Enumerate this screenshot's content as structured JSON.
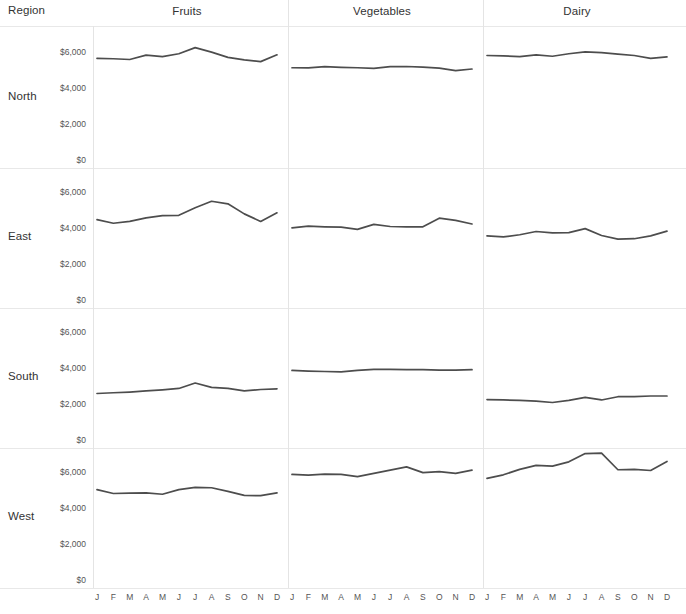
{
  "header": {
    "region_label": "Region"
  },
  "axis": {
    "y_ticks": [
      "$6,000",
      "$4,000",
      "$2,000",
      "$0"
    ],
    "y_values": [
      6000,
      4000,
      2000,
      0
    ],
    "x_ticks": [
      "J",
      "F",
      "M",
      "A",
      "M",
      "J",
      "J",
      "A",
      "S",
      "O",
      "N",
      "D"
    ]
  },
  "colors": {
    "line": "#4d4d4d",
    "gridline": "#e8e8e8",
    "divider": "#e4e4e4",
    "text": "#333333",
    "tick_text": "#555555"
  },
  "chart_data": {
    "type": "line",
    "title": "",
    "xlabel": "",
    "ylabel": "",
    "ylim": [
      0,
      7200
    ],
    "grid": true,
    "legend": "none",
    "layout": "small-multiples grid: rows = Region, columns = Category",
    "row_field": "Region",
    "column_field": "Category",
    "rows": [
      "North",
      "East",
      "South",
      "West"
    ],
    "columns": [
      "Fruits",
      "Vegetables",
      "Dairy"
    ],
    "x": [
      "J",
      "F",
      "M",
      "A",
      "M",
      "J",
      "J",
      "A",
      "S",
      "O",
      "N",
      "D"
    ],
    "panels": [
      {
        "row": "North",
        "column": "Fruits",
        "values": [
          5700,
          5680,
          5640,
          5880,
          5800,
          5960,
          6300,
          6050,
          5760,
          5620,
          5520,
          5900
        ]
      },
      {
        "row": "North",
        "column": "Vegetables",
        "values": [
          5180,
          5170,
          5240,
          5200,
          5180,
          5150,
          5240,
          5250,
          5220,
          5160,
          5020,
          5110
        ]
      },
      {
        "row": "North",
        "column": "Dairy",
        "values": [
          5860,
          5840,
          5800,
          5900,
          5820,
          5960,
          6060,
          6020,
          5940,
          5860,
          5700,
          5780
        ]
      },
      {
        "row": "East",
        "column": "Fruits",
        "values": [
          4520,
          4320,
          4420,
          4620,
          4740,
          4760,
          5180,
          5540,
          5400,
          4840,
          4420,
          4900
        ]
      },
      {
        "row": "East",
        "column": "Vegetables",
        "values": [
          4060,
          4160,
          4120,
          4100,
          3980,
          4260,
          4140,
          4120,
          4120,
          4600,
          4480,
          4280
        ]
      },
      {
        "row": "East",
        "column": "Dairy",
        "values": [
          3620,
          3560,
          3680,
          3860,
          3780,
          3800,
          4020,
          3640,
          3440,
          3460,
          3620,
          3880
        ]
      },
      {
        "row": "South",
        "column": "Fruits",
        "values": [
          2640,
          2680,
          2720,
          2780,
          2840,
          2920,
          3220,
          2980,
          2920,
          2780,
          2860,
          2900
        ]
      },
      {
        "row": "South",
        "column": "Vegetables",
        "values": [
          3920,
          3880,
          3860,
          3840,
          3920,
          3980,
          3980,
          3960,
          3960,
          3940,
          3940,
          3960
        ]
      },
      {
        "row": "South",
        "column": "Dairy",
        "values": [
          2300,
          2280,
          2260,
          2220,
          2140,
          2260,
          2420,
          2280,
          2460,
          2460,
          2500,
          2500
        ]
      },
      {
        "row": "West",
        "column": "Fruits",
        "values": [
          5080,
          4860,
          4880,
          4900,
          4820,
          5080,
          5200,
          5180,
          4980,
          4760,
          4740,
          4900
        ]
      },
      {
        "row": "West",
        "column": "Vegetables",
        "values": [
          5920,
          5880,
          5940,
          5920,
          5800,
          5980,
          6160,
          6340,
          6020,
          6080,
          5980,
          6160
        ]
      },
      {
        "row": "West",
        "column": "Dairy",
        "values": [
          5700,
          5900,
          6200,
          6420,
          6380,
          6620,
          7080,
          7100,
          6180,
          6200,
          6140,
          6640
        ]
      }
    ]
  }
}
